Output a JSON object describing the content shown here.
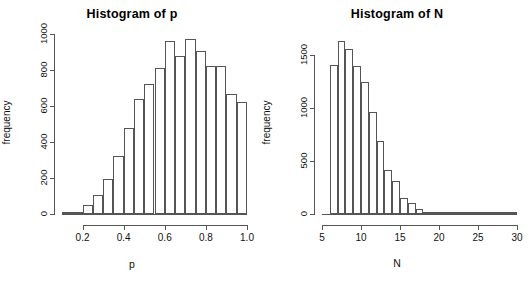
{
  "figure": {
    "background": "#ffffff",
    "line_color": "#555555",
    "text_color": "#111111"
  },
  "chart_data": [
    {
      "type": "bar",
      "id": "histogram-of-p",
      "title": "Histogram of p",
      "xlabel": "p",
      "ylabel": "frequency",
      "xlim": [
        0.1,
        1.0
      ],
      "ylim": [
        0,
        1000
      ],
      "grid": false,
      "legend": null,
      "bin_width": 0.05,
      "xticks": [
        0.2,
        0.4,
        0.6,
        0.8,
        1.0
      ],
      "xtick_labels": [
        "0.2",
        "0.4",
        "0.6",
        "0.8",
        "1.0"
      ],
      "yticks": [
        0,
        200,
        400,
        600,
        800,
        1000
      ],
      "ytick_labels": [
        "0",
        "200",
        "400",
        "600",
        "800",
        "1000"
      ],
      "bin_edges": [
        0.1,
        0.15,
        0.2,
        0.25,
        0.3,
        0.35,
        0.4,
        0.45,
        0.5,
        0.55,
        0.6,
        0.65,
        0.7,
        0.75,
        0.8,
        0.85,
        0.9,
        0.95,
        1.0
      ],
      "categories": [
        "0.10-0.15",
        "0.15-0.20",
        "0.20-0.25",
        "0.25-0.30",
        "0.30-0.35",
        "0.35-0.40",
        "0.40-0.45",
        "0.45-0.50",
        "0.50-0.55",
        "0.55-0.60",
        "0.60-0.65",
        "0.65-0.70",
        "0.70-0.75",
        "0.75-0.80",
        "0.80-0.85",
        "0.85-0.90",
        "0.90-0.95",
        "0.95-1.00"
      ],
      "values": [
        3,
        10,
        50,
        105,
        195,
        320,
        480,
        640,
        725,
        810,
        960,
        880,
        975,
        905,
        825,
        822,
        665,
        620
      ]
    },
    {
      "type": "bar",
      "id": "histogram-of-n",
      "title": "Histogram of N",
      "xlabel": "N",
      "ylabel": "frequency",
      "xlim": [
        5,
        30
      ],
      "ylim": [
        0,
        1700
      ],
      "grid": false,
      "legend": null,
      "bin_width": 1,
      "xticks": [
        5,
        10,
        15,
        20,
        25,
        30
      ],
      "xtick_labels": [
        "5",
        "10",
        "15",
        "20",
        "25",
        "30"
      ],
      "yticks": [
        0,
        500,
        1000,
        1500
      ],
      "ytick_labels": [
        "0",
        "500",
        "1000",
        "1500"
      ],
      "bin_edges": [
        6,
        7,
        8,
        9,
        10,
        11,
        12,
        13,
        14,
        15,
        16,
        17,
        18,
        19,
        20,
        21,
        22,
        23,
        24,
        25,
        26,
        27,
        28,
        29,
        30
      ],
      "categories": [
        "6-7",
        "7-8",
        "8-9",
        "9-10",
        "10-11",
        "11-12",
        "12-13",
        "13-14",
        "14-15",
        "15-16",
        "16-17",
        "17-18",
        "18-19",
        "19-20",
        "20-21",
        "21-22",
        "22-23",
        "23-24",
        "24-25",
        "25-26",
        "26-27",
        "27-28",
        "28-29",
        "29-30"
      ],
      "values": [
        1410,
        1630,
        1560,
        1395,
        1250,
        960,
        685,
        420,
        315,
        155,
        105,
        45,
        20,
        10,
        5,
        3,
        2,
        1,
        1,
        0,
        0,
        0,
        0,
        0
      ]
    }
  ]
}
